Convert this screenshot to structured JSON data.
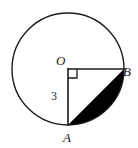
{
  "figure": {
    "kind": "circle-geometry-diagram",
    "background_color": "#ffffff",
    "stroke_color": "#1a1a1a",
    "shade_color": "#000000",
    "circle": {
      "center_label": "O",
      "center_x": 68,
      "center_y": 69,
      "radius_px": 56,
      "stroke_width": 1.3
    },
    "points": [
      {
        "id": "O",
        "label": "O",
        "x": 68,
        "y": 69,
        "role": "center"
      },
      {
        "id": "B",
        "label": "B",
        "x": 124,
        "y": 69,
        "role": "on-circle-right"
      },
      {
        "id": "A",
        "label": "A",
        "x": 68,
        "y": 125,
        "role": "on-circle-bottom"
      }
    ],
    "segments": [
      {
        "id": "OA",
        "from": "O",
        "to": "A",
        "measure_label": "3"
      },
      {
        "id": "OB",
        "from": "O",
        "to": "B",
        "measure_label": ""
      },
      {
        "id": "AB",
        "from": "A",
        "to": "B",
        "measure_label": ""
      }
    ],
    "right_angle": {
      "at": "O",
      "size_px": 9,
      "marker": "square"
    },
    "shaded_region": {
      "description": "circular segment between chord AB and minor arc AB",
      "fill": "#000000"
    },
    "labels": {
      "center": "O",
      "point_right": "B",
      "point_bottom": "A",
      "radius_measure": "3"
    }
  }
}
